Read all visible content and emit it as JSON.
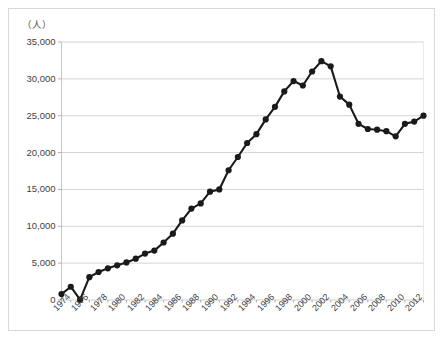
{
  "chart_data": {
    "type": "line",
    "title": "",
    "subtitle": "",
    "xlabel": "",
    "ylabel": "（人）",
    "unit_label": "（人）",
    "ylim": [
      0,
      35000
    ],
    "ytick_labels": [
      "35,000",
      "30,000",
      "25,000",
      "20,000",
      "15,000",
      "10,000",
      "5,000",
      "0"
    ],
    "ytick_values": [
      35000,
      30000,
      25000,
      20000,
      15000,
      10000,
      5000,
      0
    ],
    "grid": true,
    "grid_axis": "y",
    "legend": null,
    "legend_position": "none",
    "marker": "filled-circle",
    "line_color": "#1a1a1a",
    "marker_color": "#1a1a1a",
    "grid_color": "#c9c9c9",
    "xtick_labels": [
      "1974",
      "1976",
      "1978",
      "1980",
      "1982",
      "1984",
      "1986",
      "1988",
      "1990",
      "1992",
      "1994",
      "1996",
      "1998",
      "2000",
      "2002",
      "2004",
      "2006",
      "2008",
      "2010",
      "2012"
    ],
    "xtick_label_rotation": -45,
    "xlim": [
      1974,
      2013
    ],
    "x": [
      1974,
      1975,
      1976,
      1977,
      1978,
      1979,
      1980,
      1981,
      1982,
      1983,
      1984,
      1985,
      1986,
      1987,
      1988,
      1989,
      1990,
      1991,
      1992,
      1993,
      1994,
      1995,
      1996,
      1997,
      1998,
      1999,
      2000,
      2001,
      2002,
      2003,
      2004,
      2005,
      2006,
      2007,
      2008,
      2009,
      2010,
      2011,
      2012,
      2013
    ],
    "values": [
      800,
      1800,
      50,
      3100,
      3800,
      4300,
      4700,
      5100,
      5600,
      6300,
      6700,
      7800,
      9000,
      10800,
      12400,
      13100,
      14700,
      15000,
      17600,
      19400,
      21300,
      22500,
      24500,
      26200,
      28300,
      29700,
      29100,
      31000,
      32400,
      31700,
      27600,
      26500,
      23900,
      23200,
      23100,
      22900,
      22200,
      23900,
      24200,
      25000
    ],
    "series": [
      {
        "name": "",
        "values": [
          800,
          1800,
          50,
          3100,
          3800,
          4300,
          4700,
          5100,
          5600,
          6300,
          6700,
          7800,
          9000,
          10800,
          12400,
          13100,
          14700,
          15000,
          17600,
          19400,
          21300,
          22500,
          24500,
          26200,
          28300,
          29700,
          29100,
          31000,
          32400,
          31700,
          27600,
          26500,
          23900,
          23200,
          23100,
          22900,
          22200,
          23900,
          24200,
          25000
        ]
      }
    ],
    "annotations": []
  }
}
